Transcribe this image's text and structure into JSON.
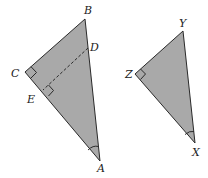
{
  "diagram": {
    "fill_color": "#a9a9a9",
    "stroke_color": "#2a2a2a",
    "triangle_ABC": {
      "vertices": {
        "A": [
          100,
          161
        ],
        "B": [
          85,
          19
        ],
        "C": [
          25,
          72
        ]
      },
      "labels": {
        "A": "A",
        "B": "B",
        "C": "C",
        "D": "D",
        "E": "E"
      },
      "points": {
        "D": [
          88,
          48
        ],
        "E": [
          43,
          90
        ]
      },
      "right_angles": [
        "C",
        "E"
      ],
      "angle_mark": "A",
      "dashed_segment": "DE"
    },
    "triangle_XYZ": {
      "vertices": {
        "X": [
          195,
          143
        ],
        "Y": [
          183,
          31
        ],
        "Z": [
          135,
          74
        ]
      },
      "labels": {
        "X": "X",
        "Y": "Y",
        "Z": "Z"
      },
      "right_angles": [
        "Z"
      ],
      "angle_mark": "X"
    }
  }
}
